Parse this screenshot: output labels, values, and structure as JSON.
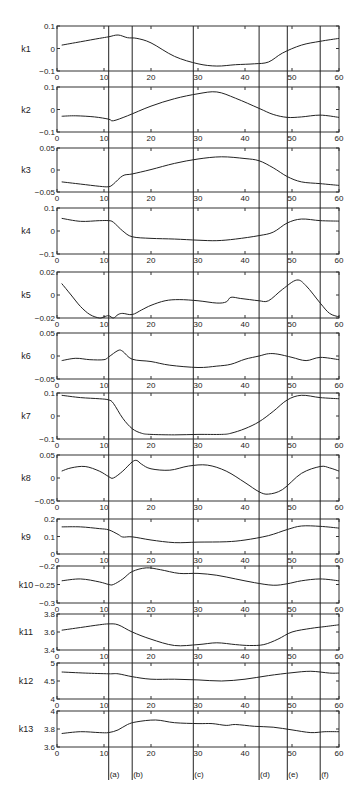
{
  "chart_data": {
    "type": "line",
    "title": "",
    "layout": "13 vertically stacked subplots sharing x-axis 0-60, with 6 vertical event marker lines labeled (a)-(f)",
    "x_axis": {
      "range": [
        0,
        60
      ],
      "ticks": [
        0,
        10,
        20,
        30,
        40,
        50,
        60
      ],
      "tick_labels": [
        "0",
        "10",
        "20",
        "30",
        "40",
        "50",
        "60"
      ],
      "xlabel": ""
    },
    "grid": false,
    "legend": null,
    "markers": [
      {
        "label": "(a)",
        "x": 11
      },
      {
        "label": "(b)",
        "x": 16
      },
      {
        "label": "(c)",
        "x": 29
      },
      {
        "label": "(d)",
        "x": 43
      },
      {
        "label": "(e)",
        "x": 49
      },
      {
        "label": "(f)",
        "x": 56
      }
    ],
    "panels": [
      {
        "name": "k1",
        "ylabel": "k1",
        "ylim": [
          -0.1,
          0.1
        ],
        "yticks": [
          -0.1,
          0,
          0.1
        ],
        "ytick_labels": [
          "-0.1",
          "0",
          "0.1"
        ],
        "x": [
          1,
          5,
          9,
          11,
          13,
          15,
          17,
          20,
          25,
          30,
          34,
          38,
          42,
          45,
          48,
          52,
          56,
          60
        ],
        "y": [
          0.015,
          0.03,
          0.045,
          0.052,
          0.06,
          0.048,
          0.045,
          0.025,
          -0.035,
          -0.068,
          -0.078,
          -0.072,
          -0.068,
          -0.06,
          -0.02,
          0.015,
          0.032,
          0.045
        ]
      },
      {
        "name": "k2",
        "ylabel": "k2",
        "ylim": [
          -0.1,
          0.1
        ],
        "yticks": [
          -0.1,
          0,
          0.1
        ],
        "ytick_labels": [
          "-0.1",
          "0",
          "0.1"
        ],
        "x": [
          1,
          4,
          8,
          11,
          12,
          15,
          20,
          25,
          30,
          34,
          38,
          43,
          46,
          49,
          52,
          56,
          60
        ],
        "y": [
          -0.03,
          -0.028,
          -0.033,
          -0.043,
          -0.05,
          -0.028,
          0.015,
          0.048,
          0.07,
          0.078,
          0.05,
          0.005,
          -0.022,
          -0.035,
          -0.033,
          -0.025,
          -0.035
        ]
      },
      {
        "name": "k3",
        "ylabel": "k3",
        "ylim": [
          -0.05,
          0.05
        ],
        "yticks": [
          -0.05,
          0,
          0.05
        ],
        "ytick_labels": [
          "-0.05",
          "0",
          "0.05"
        ],
        "x": [
          1,
          5,
          9,
          11,
          12,
          14,
          16,
          20,
          25,
          30,
          35,
          40,
          43,
          46,
          49,
          52,
          56,
          60
        ],
        "y": [
          -0.027,
          -0.032,
          -0.037,
          -0.038,
          -0.032,
          -0.013,
          -0.009,
          0.001,
          0.015,
          0.025,
          0.03,
          0.026,
          0.021,
          0.005,
          -0.015,
          -0.027,
          -0.031,
          -0.035
        ]
      },
      {
        "name": "k4",
        "ylabel": "k4",
        "ylim": [
          -0.1,
          0.1
        ],
        "yticks": [
          -0.1,
          0,
          0.1
        ],
        "ytick_labels": [
          "-0.1",
          "0",
          "0.1"
        ],
        "x": [
          1,
          5,
          9,
          11,
          12,
          14,
          16,
          20,
          25,
          30,
          34,
          38,
          43,
          46,
          49,
          52,
          56,
          60
        ],
        "y": [
          0.055,
          0.042,
          0.045,
          0.045,
          0.038,
          0.0,
          -0.025,
          -0.032,
          -0.035,
          -0.04,
          -0.042,
          -0.035,
          -0.02,
          -0.005,
          0.035,
          0.052,
          0.045,
          0.043
        ]
      },
      {
        "name": "k5",
        "ylabel": "k5",
        "ylim": [
          -0.02,
          0.02
        ],
        "yticks": [
          -0.02,
          0,
          0.02
        ],
        "ytick_labels": [
          "-0.02",
          "0",
          "0.02"
        ],
        "x": [
          1,
          3,
          5,
          7,
          9,
          10,
          11,
          12,
          13,
          14,
          16,
          18,
          20,
          23,
          26,
          30,
          34,
          36,
          37,
          39,
          41,
          43,
          45,
          48,
          51,
          53,
          56,
          58,
          60
        ],
        "y": [
          0.01,
          0.0,
          -0.01,
          -0.017,
          -0.02,
          -0.019,
          -0.018,
          -0.02,
          -0.017,
          -0.016,
          -0.017,
          -0.013,
          -0.009,
          -0.005,
          -0.004,
          -0.005,
          -0.007,
          -0.006,
          -0.002,
          -0.003,
          -0.004,
          -0.005,
          -0.005,
          0.005,
          0.013,
          0.008,
          -0.007,
          -0.016,
          -0.019
        ]
      },
      {
        "name": "k6",
        "ylabel": "k6",
        "ylim": [
          -0.05,
          0.05
        ],
        "yticks": [
          -0.05,
          0,
          0.05
        ],
        "ytick_labels": [
          "-0.05",
          "0",
          "0.05"
        ],
        "x": [
          1,
          4,
          7,
          10,
          11,
          13,
          14,
          16,
          20,
          24,
          30,
          34,
          37,
          40,
          43,
          45,
          47,
          50,
          53,
          56,
          60
        ],
        "y": [
          -0.01,
          -0.005,
          -0.008,
          -0.008,
          -0.002,
          0.012,
          0.01,
          -0.007,
          -0.012,
          -0.02,
          -0.025,
          -0.022,
          -0.018,
          -0.007,
          0.0,
          0.005,
          0.004,
          -0.003,
          -0.01,
          -0.003,
          -0.008
        ]
      },
      {
        "name": "k7",
        "ylabel": "k7",
        "ylim": [
          -0.1,
          0.1
        ],
        "yticks": [
          -0.1,
          0,
          0.1
        ],
        "ytick_labels": [
          "-0.1",
          "0",
          "0.1"
        ],
        "x": [
          1,
          5,
          9,
          11,
          12,
          14,
          16,
          18,
          20,
          25,
          30,
          35,
          37,
          40,
          43,
          46,
          49,
          52,
          56,
          60
        ],
        "y": [
          0.09,
          0.08,
          0.075,
          0.07,
          0.055,
          -0.01,
          -0.055,
          -0.075,
          -0.08,
          -0.082,
          -0.08,
          -0.08,
          -0.075,
          -0.055,
          -0.025,
          0.02,
          0.07,
          0.09,
          0.08,
          0.075
        ]
      },
      {
        "name": "k8",
        "ylabel": "k8",
        "ylim": [
          -0.05,
          0.05
        ],
        "yticks": [
          -0.05,
          0,
          0.05
        ],
        "ytick_labels": [
          "-0.05",
          "0",
          "0.05"
        ],
        "x": [
          1,
          3,
          6,
          9,
          11,
          12,
          14,
          16,
          17,
          18,
          20,
          24,
          28,
          32,
          36,
          40,
          43,
          45,
          48,
          52,
          56,
          58,
          60
        ],
        "y": [
          0.015,
          0.022,
          0.025,
          0.015,
          0.003,
          0.0,
          0.015,
          0.035,
          0.038,
          0.03,
          0.02,
          0.017,
          0.026,
          0.028,
          0.015,
          -0.01,
          -0.03,
          -0.035,
          -0.025,
          0.01,
          0.025,
          0.022,
          0.015
        ]
      },
      {
        "name": "k9",
        "ylabel": "k9",
        "ylim": [
          0,
          0.2
        ],
        "yticks": [
          0,
          0.1,
          0.2
        ],
        "ytick_labels": [
          "0",
          "0.1",
          "0.2"
        ],
        "x": [
          1,
          5,
          9,
          11,
          13,
          14,
          16,
          20,
          25,
          30,
          36,
          40,
          45,
          49,
          52,
          56,
          60
        ],
        "y": [
          0.155,
          0.155,
          0.145,
          0.138,
          0.112,
          0.097,
          0.098,
          0.08,
          0.065,
          0.068,
          0.07,
          0.08,
          0.105,
          0.14,
          0.16,
          0.158,
          0.148
        ]
      },
      {
        "name": "k10",
        "ylabel": "k10",
        "ylim": [
          -0.3,
          -0.2
        ],
        "yticks": [
          -0.3,
          -0.25,
          -0.2
        ],
        "ytick_labels": [
          "-0.3",
          "-0.25",
          "-0.2"
        ],
        "x": [
          1,
          5,
          9,
          11,
          12,
          14,
          16,
          19,
          22,
          26,
          30,
          34,
          38,
          42,
          46,
          49,
          52,
          56,
          60
        ],
        "y": [
          -0.24,
          -0.235,
          -0.243,
          -0.25,
          -0.25,
          -0.235,
          -0.215,
          -0.205,
          -0.21,
          -0.22,
          -0.22,
          -0.225,
          -0.235,
          -0.245,
          -0.252,
          -0.248,
          -0.24,
          -0.235,
          -0.24
        ]
      },
      {
        "name": "k11",
        "ylabel": "k11",
        "ylim": [
          3.4,
          3.8
        ],
        "yticks": [
          3.4,
          3.6,
          3.8
        ],
        "ytick_labels": [
          "3.4",
          "3.6",
          "3.8"
        ],
        "x": [
          1,
          5,
          9,
          11,
          13,
          16,
          20,
          25,
          30,
          34,
          38,
          41,
          44,
          47,
          50,
          54,
          57,
          60
        ],
        "y": [
          3.62,
          3.65,
          3.68,
          3.69,
          3.68,
          3.6,
          3.52,
          3.45,
          3.46,
          3.48,
          3.46,
          3.45,
          3.46,
          3.52,
          3.6,
          3.64,
          3.66,
          3.68
        ]
      },
      {
        "name": "k12",
        "ylabel": "k12",
        "ylim": [
          4,
          5
        ],
        "yticks": [
          4,
          4.5,
          5
        ],
        "ytick_labels": [
          "4",
          "4.5",
          "5"
        ],
        "x": [
          1,
          6,
          11,
          13,
          16,
          20,
          25,
          30,
          35,
          40,
          45,
          50,
          54,
          58,
          60
        ],
        "y": [
          4.75,
          4.72,
          4.7,
          4.7,
          4.62,
          4.55,
          4.55,
          4.53,
          4.5,
          4.55,
          4.65,
          4.73,
          4.77,
          4.72,
          4.72
        ]
      },
      {
        "name": "k13",
        "ylabel": "k13",
        "ylim": [
          3.6,
          4
        ],
        "yticks": [
          3.6,
          3.8,
          4
        ],
        "ytick_labels": [
          "3.6",
          "3.8",
          "4"
        ],
        "x": [
          1,
          5,
          9,
          11,
          13,
          15,
          17,
          21,
          25,
          30,
          33,
          36,
          38,
          42,
          46,
          50,
          54,
          57,
          60
        ],
        "y": [
          3.75,
          3.77,
          3.76,
          3.76,
          3.79,
          3.85,
          3.88,
          3.9,
          3.87,
          3.86,
          3.86,
          3.84,
          3.85,
          3.83,
          3.82,
          3.79,
          3.76,
          3.77,
          3.77
        ]
      }
    ]
  }
}
